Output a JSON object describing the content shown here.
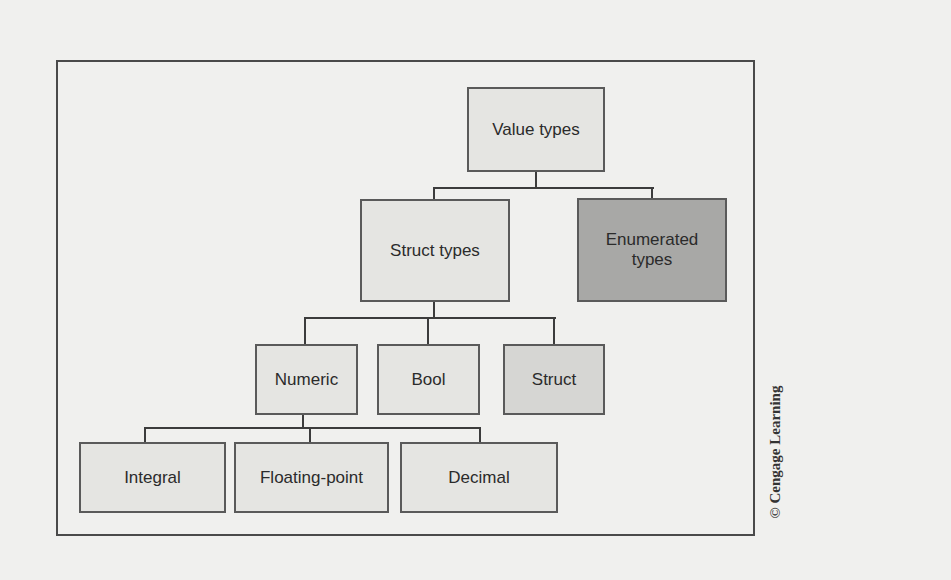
{
  "diagram": {
    "type": "tree",
    "nodes": {
      "value_types": "Value types",
      "struct_types": "Struct types",
      "enumerated_types": "Enumerated types",
      "numeric": "Numeric",
      "bool": "Bool",
      "struct": "Struct",
      "integral": "Integral",
      "floating_point": "Floating-point",
      "decimal": "Decimal"
    },
    "edges": [
      [
        "Value types",
        "Struct types"
      ],
      [
        "Value types",
        "Enumerated types"
      ],
      [
        "Struct types",
        "Numeric"
      ],
      [
        "Struct types",
        "Bool"
      ],
      [
        "Struct types",
        "Struct"
      ],
      [
        "Numeric",
        "Integral"
      ],
      [
        "Numeric",
        "Floating-point"
      ],
      [
        "Numeric",
        "Decimal"
      ]
    ],
    "colors": {
      "background": "#f0f0ee",
      "node_fill": "#e5e5e2",
      "highlight_dark": "#a8a8a6",
      "highlight_mid": "#d6d6d3",
      "border": "#5a5a5a"
    }
  },
  "credit": "© Cengage Learning"
}
